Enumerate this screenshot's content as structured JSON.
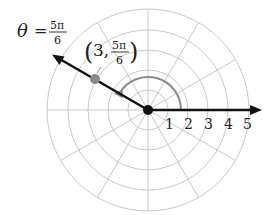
{
  "diagram": {
    "type": "polar-grid",
    "center": {
      "x": 148,
      "y": 110
    },
    "ring_spacing_px": 20,
    "ring_count": 5,
    "spoke_step_deg": 30,
    "colors": {
      "grid": "#c8c8c8",
      "axis": "#111111",
      "point": "#8a8a8a",
      "arc": "#8a8a8a"
    },
    "axis_labels": [
      "1",
      "2",
      "3",
      "4",
      "5"
    ],
    "ray": {
      "label_theta": "θ",
      "label_equals": "=",
      "label_numerator": "5π",
      "label_denominator": "6",
      "angle_deg": 150
    },
    "point": {
      "r": 3,
      "theta_deg": 150,
      "label_open": "(",
      "label_r": "3,",
      "label_numerator": "5π",
      "label_denominator": "6",
      "label_close": ")"
    }
  }
}
